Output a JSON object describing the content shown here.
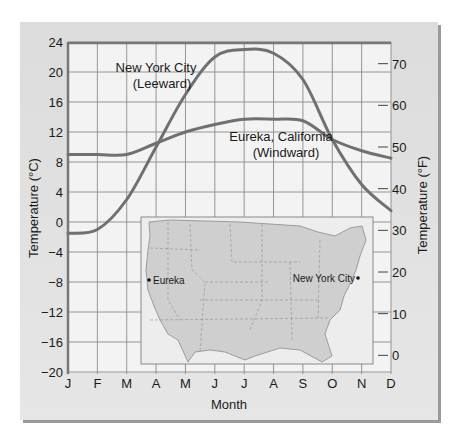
{
  "chart_data": {
    "type": "line",
    "title": "",
    "xlabel": "Month",
    "ylabel": "Temperature (°C)",
    "ylabel_right": "Temperature (°F)",
    "categories": [
      "J",
      "F",
      "M",
      "A",
      "M",
      "J",
      "J",
      "A",
      "S",
      "O",
      "N",
      "D"
    ],
    "ylim": [
      -20,
      24
    ],
    "yticks": [
      24,
      20,
      16,
      12,
      8,
      4,
      0,
      -4,
      -8,
      -12,
      -16,
      -20
    ],
    "yticks_right": [
      70,
      60,
      50,
      40,
      30,
      20,
      10,
      0
    ],
    "grid": true,
    "series": [
      {
        "name": "New York City (Leeward)",
        "values": [
          -1.5,
          -1,
          3,
          10,
          17,
          22,
          23,
          22.5,
          19,
          11,
          5,
          1.5
        ]
      },
      {
        "name": "Eureka, California (Windward)",
        "values": [
          9,
          9,
          9,
          10.5,
          12,
          13,
          13.7,
          13.7,
          13.5,
          11,
          9.5,
          8.5
        ]
      }
    ],
    "annotations": [
      {
        "text": "New York City",
        "sub": "(Leeward)"
      },
      {
        "text": "Eureka, California",
        "sub": "(Windward)"
      }
    ],
    "inset_map": {
      "labels": [
        "Eureka",
        "New York City"
      ]
    }
  },
  "labels": {
    "nyc_line1": "New York City",
    "nyc_line2": "(Leeward)",
    "eureka_line1": "Eureka, California",
    "eureka_line2": "(Windward)",
    "xaxis": "Month",
    "yaxis_left": "Temperature (°C)",
    "yaxis_right": "Temperature (°F)",
    "map_eureka": "Eureka",
    "map_nyc": "New York City"
  },
  "colors": {
    "curve": "#707070",
    "grid": "#8a8a8a",
    "plot_bg": "#f4f4f4",
    "map_land": "#cfcfcf",
    "map_water": "#ececec"
  }
}
